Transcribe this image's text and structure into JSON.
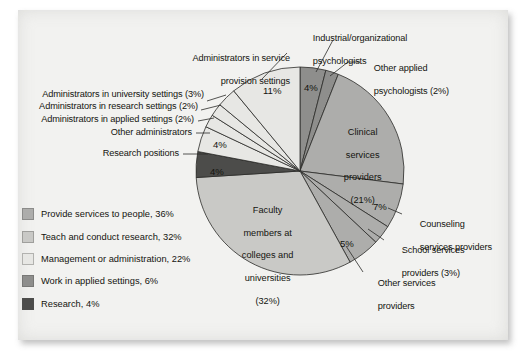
{
  "chart_data": {
    "type": "pie",
    "title": "",
    "subtitle": "",
    "xlabel": "",
    "ylabel": "",
    "legend_position": "bottom-left",
    "grid": false,
    "total": 100,
    "units": "%",
    "start_angle_deg": 0,
    "direction": "clockwise",
    "categories": [
      "Industrial/organizational psychologists",
      "Other applied psychologists",
      "Clinical services providers",
      "Counseling services providers",
      "School services providers",
      "Other services providers",
      "Faculty members at colleges and universities",
      "Research positions",
      "Other administrators",
      "Administrators in applied settings",
      "Administrators in research settings",
      "Administrators in university settings",
      "Administrators in service provision settings"
    ],
    "values": [
      4,
      2,
      21,
      7,
      3,
      5,
      32,
      4,
      4,
      2,
      2,
      3,
      11
    ],
    "slices": [
      {
        "id": "io-psych",
        "label": "Industrial/organizational\npsychologists",
        "value": 4,
        "pct_text": "4%",
        "color": "#8e8e8c",
        "group": "Work in applied settings",
        "callout": true
      },
      {
        "id": "other-applied",
        "label": "Other applied\npsychologists (2%)",
        "value": 2,
        "pct_text": "",
        "color": "#8e8e8c",
        "group": "Work in applied settings",
        "callout": true
      },
      {
        "id": "clinical",
        "label": "Clinical\nservices\nproviders\n(21%)",
        "value": 21,
        "pct_text": "",
        "color": "#adadab",
        "group": "Provide services to people",
        "callout": false
      },
      {
        "id": "counseling",
        "label": "Counseling\nservices providers",
        "value": 7,
        "pct_text": "7%",
        "color": "#adadab",
        "group": "Provide services to people",
        "callout": true
      },
      {
        "id": "school",
        "label": "School services\nproviders (3%)",
        "value": 3,
        "pct_text": "",
        "color": "#adadab",
        "group": "Provide services to people",
        "callout": true
      },
      {
        "id": "other-services",
        "label": "Other services\nproviders",
        "value": 5,
        "pct_text": "5%",
        "color": "#adadab",
        "group": "Provide services to people",
        "callout": true
      },
      {
        "id": "faculty",
        "label": "Faculty\nmembers at\ncolleges and\nuniversities\n(32%)",
        "value": 32,
        "pct_text": "",
        "color": "#c9c9c6",
        "group": "Teach and conduct research",
        "callout": false
      },
      {
        "id": "research-pos",
        "label": "Research positions",
        "value": 4,
        "pct_text": "4%",
        "color": "#4c4c4a",
        "group": "Research",
        "callout": true
      },
      {
        "id": "other-admin",
        "label": "Other administrators",
        "value": 4,
        "pct_text": "4%",
        "color": "#e7e7e4",
        "group": "Management or administration",
        "callout": true
      },
      {
        "id": "admin-applied",
        "label": "Administrators in applied settings (2%)",
        "value": 2,
        "pct_text": "",
        "color": "#e7e7e4",
        "group": "Management or administration",
        "callout": true
      },
      {
        "id": "admin-research",
        "label": "Administrators in research settings (2%)",
        "value": 2,
        "pct_text": "",
        "color": "#e7e7e4",
        "group": "Management or administration",
        "callout": true
      },
      {
        "id": "admin-univ",
        "label": "Administrators in university settings (3%)",
        "value": 3,
        "pct_text": "",
        "color": "#e7e7e4",
        "group": "Management or administration",
        "callout": true
      },
      {
        "id": "admin-service",
        "label": "Administrators in service\nprovision settings",
        "value": 11,
        "pct_text": "11%",
        "color": "#e7e7e4",
        "group": "Management or administration",
        "callout": true
      }
    ],
    "legend": [
      {
        "label": "Provide services to people, 36%",
        "value": 36,
        "color": "#adadab"
      },
      {
        "label": "Teach and conduct research, 32%",
        "value": 32,
        "color": "#c9c9c6"
      },
      {
        "label": "Management or administration, 22%",
        "value": 22,
        "color": "#e7e7e4"
      },
      {
        "label": "Work in applied settings, 6%",
        "value": 6,
        "color": "#8e8e8c"
      },
      {
        "label": "Research, 4%",
        "value": 4,
        "color": "#4c4c4a"
      }
    ]
  },
  "callouts": {
    "io_psych": {
      "line1": "Industrial/organizational",
      "line2": "psychologists"
    },
    "other_applied": {
      "line1": "Other applied",
      "line2": "psychologists (2%)"
    },
    "admin_service": {
      "line1": "Administrators in service",
      "line2": "provision settings"
    },
    "admin_univ": {
      "line1": "Administrators in university settings (3%)"
    },
    "admin_research": {
      "line1": "Administrators in research settings (2%)"
    },
    "admin_applied": {
      "line1": "Administrators in applied settings (2%)"
    },
    "other_admin": {
      "line1": "Other administrators"
    },
    "research_pos": {
      "line1": "Research positions"
    },
    "counseling": {
      "line1": "Counseling",
      "line2": "services providers"
    },
    "school": {
      "line1": "School services",
      "line2": "providers (3%)"
    },
    "other_services": {
      "line1": "Other services",
      "line2": "providers"
    }
  },
  "in_pie_labels": {
    "clinical": {
      "l1": "Clinical",
      "l2": "services",
      "l3": "providers",
      "l4": "(21%)"
    },
    "faculty": {
      "l1": "Faculty",
      "l2": "members at",
      "l3": "colleges and",
      "l4": "universities",
      "l5": "(32%)"
    }
  },
  "percent_labels": {
    "io_psych": "4%",
    "admin_service": "11%",
    "other_admin": "4%",
    "research_pos": "4%",
    "counseling": "7%",
    "other_services": "5%"
  }
}
